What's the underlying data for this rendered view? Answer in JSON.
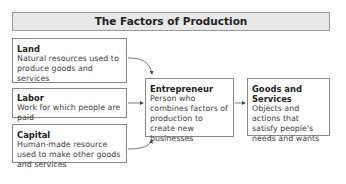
{
  "title": "The Factors of Production",
  "factors": [
    {
      "name": "Land",
      "description": "Natural resources used to produce goods and services"
    },
    {
      "name": "Labor",
      "description": "Work for which people are paid"
    },
    {
      "name": "Capital",
      "description": "Human-made resource used to make other goods and services"
    }
  ],
  "entrepreneur": {
    "name": "Entrepreneur",
    "description": "Person who combines factors of production to create new businesses"
  },
  "output": {
    "name": "Goods and Services",
    "description": "Objects and actions that satisfy people's needs and wants"
  },
  "colors": {
    "title_bg": "#e8e8e8",
    "border": "#888888",
    "arrow": "#555555"
  }
}
